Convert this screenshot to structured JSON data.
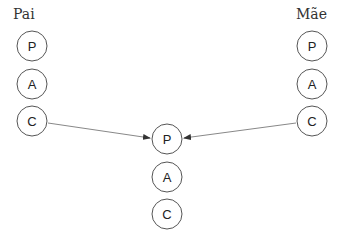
{
  "diagram": {
    "parents": {
      "left": {
        "label": "Pai",
        "nodes": [
          "P",
          "A",
          "C"
        ]
      },
      "right": {
        "label": "Mãe",
        "nodes": [
          "P",
          "A",
          "C"
        ]
      }
    },
    "child": {
      "nodes": [
        "P",
        "A",
        "C"
      ]
    },
    "edges": [
      {
        "from": "left.C",
        "to": "child.P"
      },
      {
        "from": "right.C",
        "to": "child.P"
      }
    ],
    "colors": {
      "stroke": "#555555",
      "edge": "#888888",
      "text": "#222222"
    }
  }
}
